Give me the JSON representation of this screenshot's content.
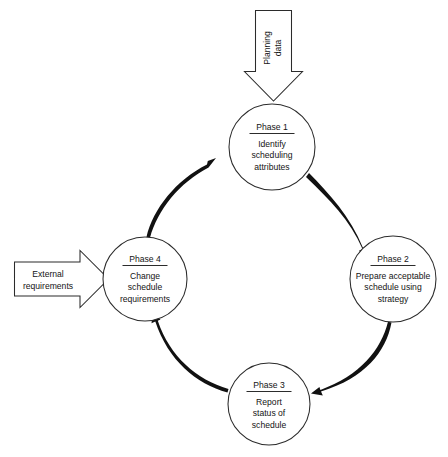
{
  "diagram": {
    "type": "cycle-flow-diagram",
    "background_color": "#ffffff",
    "line_color": "#2b2b2b",
    "text_color": "#141414",
    "phases": [
      {
        "id": "phase-1",
        "title": "Phase 1",
        "lines": [
          "Identify",
          "scheduling",
          "attributes"
        ],
        "line1": "Identify",
        "line2": "scheduling",
        "line3": "attributes",
        "position": "top",
        "cx": 272,
        "cy": 147,
        "r": 43
      },
      {
        "id": "phase-2",
        "title": "Phase 2",
        "lines": [
          "Prepare acceptable",
          "schedule using",
          "strategy"
        ],
        "line1": "Prepare acceptable",
        "line2": "schedule using",
        "line3": "strategy",
        "position": "right",
        "cx": 393,
        "cy": 279,
        "r": 43
      },
      {
        "id": "phase-3",
        "title": "Phase 3",
        "lines": [
          "Report",
          "status of",
          "schedule"
        ],
        "line1": "Report",
        "line2": "status of",
        "line3": "schedule",
        "position": "bottom",
        "cx": 269,
        "cy": 404,
        "r": 41
      },
      {
        "id": "phase-4",
        "title": "Phase 4",
        "lines": [
          "Change",
          "schedule",
          "requirements"
        ],
        "line1": "Change",
        "line2": "schedule",
        "line3": "requirements",
        "position": "left",
        "cx": 145,
        "cy": 279,
        "r": 42
      }
    ],
    "inputs": [
      {
        "id": "planning-data-input",
        "line1": "Planning",
        "line2": "data",
        "direction": "down",
        "target": "phase-1",
        "orientation": "vertical-text"
      },
      {
        "id": "external-requirements-input",
        "line1": "External",
        "line2": "requirements",
        "direction": "right",
        "target": "phase-4",
        "orientation": "horizontal-text"
      }
    ],
    "flow_arrows": [
      {
        "id": "arc-1-to-2",
        "from": "phase-1",
        "to": "phase-2",
        "direction": "clockwise"
      },
      {
        "id": "arc-2-to-3",
        "from": "phase-2",
        "to": "phase-3",
        "direction": "clockwise"
      },
      {
        "id": "arc-3-to-4",
        "from": "phase-3",
        "to": "phase-4",
        "direction": "clockwise"
      },
      {
        "id": "arc-4-to-1",
        "from": "phase-4",
        "to": "phase-1",
        "direction": "clockwise"
      }
    ]
  }
}
